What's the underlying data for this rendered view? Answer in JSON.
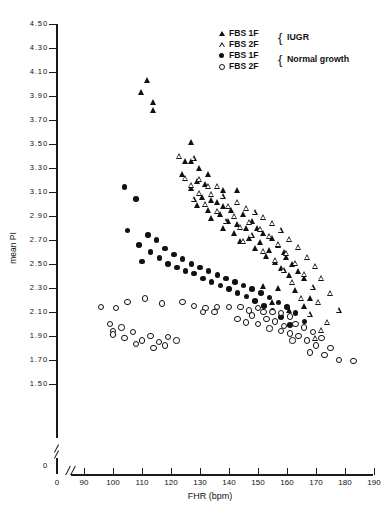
{
  "chart_data": {
    "type": "scatter",
    "title": "",
    "xlabel": "FHR (bpm)",
    "ylabel": "mean PI",
    "xlim": [
      90,
      190
    ],
    "ylim": [
      1.5,
      4.5
    ],
    "xticks": [
      0,
      90,
      100,
      110,
      120,
      130,
      140,
      150,
      160,
      170,
      180,
      190
    ],
    "yticks": [
      0,
      1.5,
      1.7,
      1.9,
      2.1,
      2.3,
      2.5,
      2.7,
      2.9,
      3.1,
      3.3,
      3.5,
      3.7,
      3.9,
      4.1,
      4.3,
      4.5
    ],
    "xtick_labels": [
      "0",
      "90",
      "100",
      "110",
      "120",
      "130",
      "140",
      "150",
      "160",
      "170",
      "180",
      "190"
    ],
    "ytick_labels": [
      "0",
      "1.50",
      "1.70",
      "1.90",
      "2.10",
      "2.30",
      "2.50",
      "2.70",
      "2.90",
      "3.10",
      "3.30",
      "3.50",
      "3.70",
      "3.90",
      "4.10",
      "4.30",
      "4.50"
    ],
    "axis_break_x": true,
    "axis_break_y": true,
    "grid": false,
    "legend_position": "top-right",
    "series": [
      {
        "name": "FBS 1F",
        "group": "IUGR",
        "marker": "filled-triangle",
        "color": "#111111",
        "points": [
          [
            112,
            4.03
          ],
          [
            110,
            3.93
          ],
          [
            114,
            3.85
          ],
          [
            114,
            3.78
          ],
          [
            127,
            3.52
          ],
          [
            125,
            3.36
          ],
          [
            127,
            3.36
          ],
          [
            130,
            3.3
          ],
          [
            124,
            3.25
          ],
          [
            133,
            3.25
          ],
          [
            129,
            3.19
          ],
          [
            132,
            3.17
          ],
          [
            127,
            3.13
          ],
          [
            138,
            3.12
          ],
          [
            143,
            3.12
          ],
          [
            131,
            3.06
          ],
          [
            134,
            3.03
          ],
          [
            136,
            3.02
          ],
          [
            129,
            2.99
          ],
          [
            138,
            2.98
          ],
          [
            133,
            2.95
          ],
          [
            141,
            2.95
          ],
          [
            137,
            2.92
          ],
          [
            145,
            2.92
          ],
          [
            134,
            2.88
          ],
          [
            140,
            2.86
          ],
          [
            148,
            2.86
          ],
          [
            143,
            2.83
          ],
          [
            138,
            2.8
          ],
          [
            146,
            2.8
          ],
          [
            150,
            2.8
          ],
          [
            142,
            2.76
          ],
          [
            152,
            2.76
          ],
          [
            147,
            2.72
          ],
          [
            155,
            2.72
          ],
          [
            144,
            2.69
          ],
          [
            151,
            2.68
          ],
          [
            157,
            2.66
          ],
          [
            149,
            2.63
          ],
          [
            154,
            2.62
          ],
          [
            159,
            2.6
          ],
          [
            153,
            2.57
          ],
          [
            160,
            2.56
          ],
          [
            156,
            2.52
          ],
          [
            162,
            2.5
          ],
          [
            158,
            2.47
          ],
          [
            164,
            2.44
          ],
          [
            161,
            2.41
          ],
          [
            166,
            2.38
          ],
          [
            152,
            2.32
          ],
          [
            157,
            2.3
          ],
          [
            163,
            2.28
          ],
          [
            168,
            2.22
          ],
          [
            155,
            2.18
          ],
          [
            166,
            2.15
          ],
          [
            161,
            2.12
          ]
        ]
      },
      {
        "name": "FBS 2F",
        "group": "IUGR",
        "marker": "open-triangle",
        "color": "#111111",
        "points": [
          [
            123,
            3.4
          ],
          [
            128,
            3.38
          ],
          [
            125,
            3.22
          ],
          [
            130,
            3.21
          ],
          [
            127,
            3.16
          ],
          [
            133,
            3.15
          ],
          [
            136,
            3.15
          ],
          [
            130,
            3.09
          ],
          [
            134,
            3.08
          ],
          [
            138,
            3.07
          ],
          [
            128,
            3.04
          ],
          [
            143,
            3.02
          ],
          [
            132,
            3.0
          ],
          [
            140,
            2.98
          ],
          [
            146,
            2.97
          ],
          [
            136,
            2.94
          ],
          [
            149,
            2.93
          ],
          [
            142,
            2.9
          ],
          [
            152,
            2.89
          ],
          [
            139,
            2.86
          ],
          [
            147,
            2.85
          ],
          [
            155,
            2.84
          ],
          [
            144,
            2.81
          ],
          [
            151,
            2.79
          ],
          [
            158,
            2.78
          ],
          [
            148,
            2.74
          ],
          [
            154,
            2.73
          ],
          [
            161,
            2.71
          ],
          [
            145,
            2.69
          ],
          [
            157,
            2.67
          ],
          [
            164,
            2.64
          ],
          [
            152,
            2.61
          ],
          [
            160,
            2.59
          ],
          [
            167,
            2.56
          ],
          [
            156,
            2.53
          ],
          [
            163,
            2.51
          ],
          [
            170,
            2.48
          ],
          [
            159,
            2.45
          ],
          [
            166,
            2.42
          ],
          [
            172,
            2.38
          ],
          [
            162,
            2.35
          ],
          [
            169,
            2.31
          ],
          [
            175,
            2.26
          ],
          [
            165,
            2.22
          ],
          [
            171,
            2.18
          ],
          [
            178,
            2.12
          ],
          [
            168,
            2.08
          ],
          [
            174,
            2.02
          ],
          [
            172,
            1.95
          ],
          [
            170,
            1.88
          ]
        ]
      },
      {
        "name": "FBS 1F",
        "group": "Normal growth",
        "marker": "filled-circle",
        "color": "#111111",
        "points": [
          [
            104,
            3.14
          ],
          [
            108,
            3.04
          ],
          [
            105,
            2.78
          ],
          [
            112,
            2.74
          ],
          [
            115,
            2.7
          ],
          [
            109,
            2.66
          ],
          [
            118,
            2.63
          ],
          [
            113,
            2.6
          ],
          [
            121,
            2.58
          ],
          [
            116,
            2.55
          ],
          [
            124,
            2.54
          ],
          [
            110,
            2.52
          ],
          [
            119,
            2.5
          ],
          [
            127,
            2.5
          ],
          [
            122,
            2.47
          ],
          [
            130,
            2.47
          ],
          [
            125,
            2.44
          ],
          [
            133,
            2.44
          ],
          [
            128,
            2.42
          ],
          [
            136,
            2.41
          ],
          [
            131,
            2.38
          ],
          [
            139,
            2.38
          ],
          [
            134,
            2.35
          ],
          [
            142,
            2.35
          ],
          [
            137,
            2.32
          ],
          [
            145,
            2.32
          ],
          [
            140,
            2.29
          ],
          [
            148,
            2.29
          ],
          [
            143,
            2.26
          ],
          [
            151,
            2.26
          ],
          [
            146,
            2.23
          ],
          [
            154,
            2.22
          ],
          [
            149,
            2.19
          ],
          [
            157,
            2.18
          ],
          [
            152,
            2.15
          ],
          [
            160,
            2.14
          ],
          [
            155,
            2.11
          ],
          [
            163,
            2.09
          ],
          [
            158,
            2.06
          ],
          [
            166,
            2.02
          ],
          [
            161,
            1.99
          ]
        ]
      },
      {
        "name": "FBS 2F",
        "group": "Normal growth",
        "marker": "open-circle",
        "color": "#111111",
        "points": [
          [
            96,
            2.14
          ],
          [
            101,
            2.13
          ],
          [
            105,
            2.18
          ],
          [
            111,
            2.21
          ],
          [
            99,
            2.0
          ],
          [
            103,
            1.97
          ],
          [
            100,
            1.94
          ],
          [
            100,
            1.91
          ],
          [
            107,
            1.93
          ],
          [
            104,
            1.88
          ],
          [
            110,
            1.86
          ],
          [
            113,
            1.9
          ],
          [
            108,
            1.83
          ],
          [
            116,
            1.85
          ],
          [
            119,
            1.89
          ],
          [
            114,
            1.8
          ],
          [
            122,
            1.86
          ],
          [
            118,
            1.82
          ],
          [
            117,
            2.17
          ],
          [
            124,
            2.18
          ],
          [
            128,
            2.15
          ],
          [
            132,
            2.13
          ],
          [
            136,
            2.14
          ],
          [
            140,
            2.14
          ],
          [
            144,
            2.14
          ],
          [
            131,
            2.1
          ],
          [
            135,
            2.1
          ],
          [
            147,
            2.11
          ],
          [
            150,
            2.13
          ],
          [
            152,
            2.1
          ],
          [
            148,
            2.07
          ],
          [
            155,
            2.1
          ],
          [
            158,
            2.09
          ],
          [
            161,
            2.06
          ],
          [
            153,
            2.04
          ],
          [
            143,
            2.04
          ],
          [
            146,
            2.01
          ],
          [
            150,
            2.0
          ],
          [
            156,
            2.02
          ],
          [
            159,
            1.98
          ],
          [
            163,
            2.0
          ],
          [
            166,
            1.97
          ],
          [
            154,
            1.96
          ],
          [
            158,
            1.94
          ],
          [
            161,
            1.92
          ],
          [
            169,
            1.93
          ],
          [
            164,
            1.9
          ],
          [
            167,
            1.86
          ],
          [
            172,
            1.88
          ],
          [
            170,
            1.82
          ],
          [
            175,
            1.8
          ],
          [
            178,
            1.7
          ],
          [
            183,
            1.69
          ],
          [
            173,
            1.74
          ],
          [
            168,
            1.76
          ],
          [
            162,
            1.86
          ]
        ]
      }
    ]
  },
  "legend": {
    "rows": [
      {
        "label": "FBS 1F",
        "marker": "filled-triangle"
      },
      {
        "label": "FBS 2F",
        "marker": "open-triangle"
      },
      {
        "label": "FBS 1F",
        "marker": "filled-circle"
      },
      {
        "label": "FBS 2F",
        "marker": "open-circle"
      }
    ],
    "brace": "{",
    "group1": "IUGR",
    "group2": "Normal growth"
  }
}
